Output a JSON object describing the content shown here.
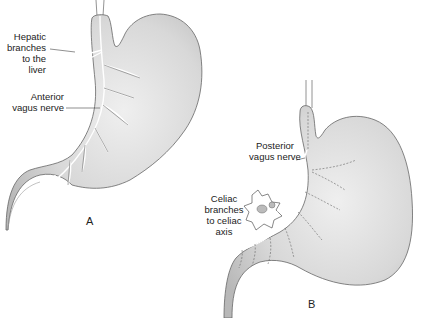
{
  "figure": {
    "panels": [
      {
        "id": "A",
        "letter": "A",
        "labels": {
          "hepatic": [
            "Hepatic",
            "branches",
            "to the",
            "liver"
          ],
          "anterior": [
            "Anterior",
            "vagus nerve"
          ]
        }
      },
      {
        "id": "B",
        "letter": "B",
        "labels": {
          "posterior": [
            "Posterior",
            "vagus nerve"
          ],
          "celiac": [
            "Celiac",
            "branches",
            "to celiac",
            "axis"
          ]
        }
      }
    ],
    "colors": {
      "stomach_fill": "#dcdcdc",
      "stomach_shade": "#bdbdbd",
      "outline": "#555555",
      "nerve": "#ffffff",
      "text": "#222222"
    }
  }
}
